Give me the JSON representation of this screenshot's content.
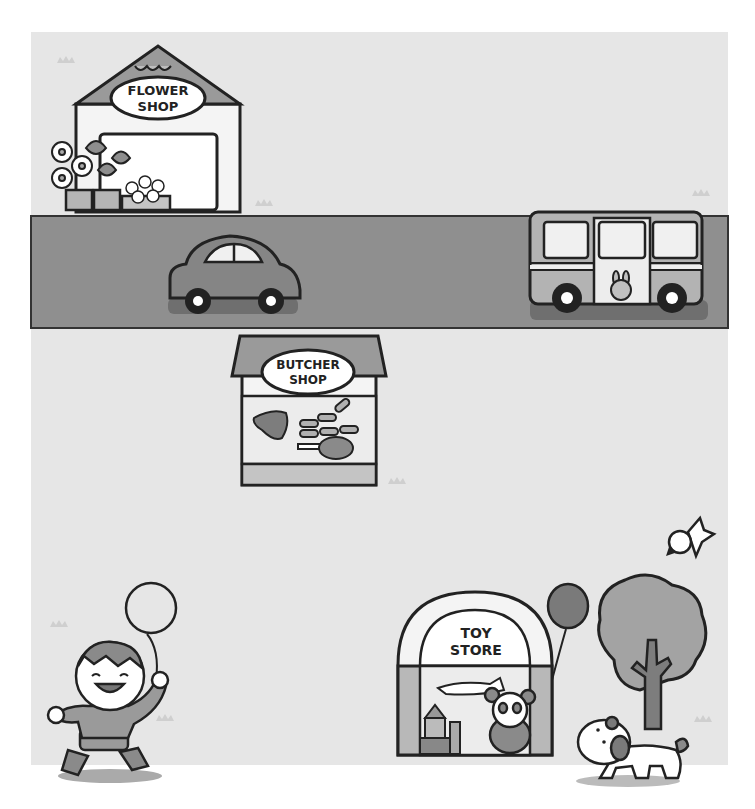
{
  "scene": {
    "title": "Town street illustration",
    "colors": {
      "background": "#e6e6e6",
      "road": "#8f8f8f",
      "outline": "#222222",
      "roof": "#9a9a9a",
      "car": "#858585",
      "bus": "#b3b3b3",
      "tree": "#a3a3a3",
      "trunk": "#7d7d7d",
      "crown": "#cfcfcf"
    }
  },
  "signs": {
    "flower_shop": {
      "line1": "FLOWER",
      "line2": "SHOP"
    },
    "butcher_shop": {
      "line1": "BUTCHER",
      "line2": "SHOP"
    },
    "toy_store": {
      "line1": "TOY",
      "line2": "STORE"
    }
  },
  "objects": [
    "flower-shop",
    "car",
    "bus",
    "butcher-shop",
    "toy-store",
    "boy-with-balloon",
    "tree",
    "bird",
    "dog"
  ]
}
